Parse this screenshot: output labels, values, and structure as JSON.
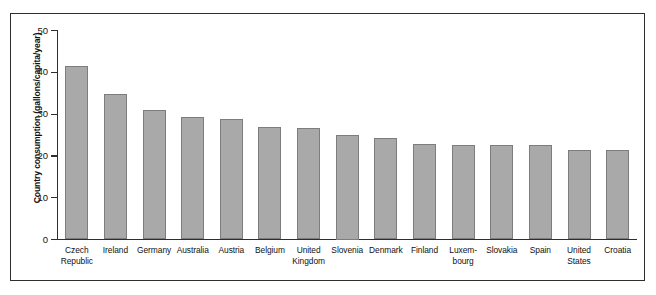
{
  "chart_data": {
    "type": "bar",
    "title": "",
    "xlabel": "",
    "ylabel": "Country consumption (gallons/capita/year)",
    "ylim": [
      0,
      50
    ],
    "yticks": [
      0,
      10,
      20,
      30,
      40,
      50
    ],
    "ytick_labels": [
      "0",
      "10",
      "20",
      "30",
      "40",
      "50"
    ],
    "grid": false,
    "legend": null,
    "bar_fill_color": "#a9a9a9",
    "bar_edge_color": "#7d7d7d",
    "frame_color": "#2e2e2e",
    "categories": [
      "Czech\nRepublic",
      "Ireland",
      "Germany",
      "Australia",
      "Austria",
      "Belgium",
      "United\nKingdom",
      "Slovenia",
      "Denmark",
      "Finland",
      "Luxem-\nbourg",
      "Slovakia",
      "Spain",
      "United\nStates",
      "Croatia"
    ],
    "values": [
      41.6,
      34.8,
      31.0,
      29.3,
      28.8,
      26.9,
      26.6,
      25.0,
      24.2,
      22.9,
      22.7,
      22.6,
      22.5,
      21.5,
      21.4
    ]
  }
}
